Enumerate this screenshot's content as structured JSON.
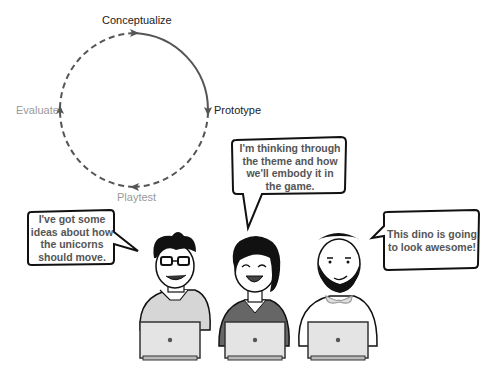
{
  "cycle": {
    "stages": [
      {
        "label": "Conceptualize",
        "state": "active"
      },
      {
        "label": "Prototype",
        "state": "active"
      },
      {
        "label": "Playtest",
        "state": "inactive"
      },
      {
        "label": "Evaluate",
        "state": "inactive"
      }
    ],
    "colors": {
      "active": "#555555",
      "inactive_text": "#999999",
      "active_text": "#222222"
    }
  },
  "characters": [
    {
      "name": "glasses-guy",
      "shirt": "light-gray polo",
      "bubble": [
        "I've got some",
        "ideas about how",
        "the unicorns",
        "should move."
      ]
    },
    {
      "name": "woman",
      "shirt": "dark-gray v-neck",
      "bubble": [
        "I'm thinking through",
        "the theme and how",
        "we'll embody it in",
        "the game."
      ]
    },
    {
      "name": "bearded-guy",
      "shirt": "white with bow tie",
      "bubble": [
        "This dino is going",
        "to look awesome!"
      ]
    }
  ]
}
